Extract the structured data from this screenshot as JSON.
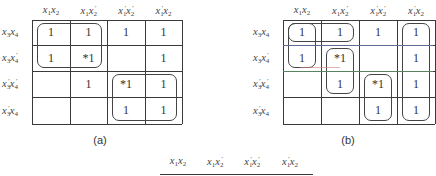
{
  "maps": [
    {
      "id": "a",
      "caption": "(a)",
      "columns": [
        "x1x2",
        "x1x2'",
        "x1'x2'",
        "x1'x2"
      ],
      "rows": [
        "x3x4",
        "x3x4'",
        "x3'x4'",
        "x3'x4"
      ],
      "cells": [
        [
          "1",
          "1",
          "1",
          "1"
        ],
        [
          "1",
          "*1",
          "",
          "1"
        ],
        [
          "",
          "1",
          "*1",
          "1"
        ],
        [
          "",
          "",
          "1",
          "1"
        ]
      ],
      "groups": [
        {
          "rows": [
            0,
            1
          ],
          "cols": [
            0,
            1
          ]
        },
        {
          "rows": [
            2,
            3
          ],
          "cols": [
            2,
            3
          ]
        }
      ]
    },
    {
      "id": "b",
      "caption": "(b)",
      "columns": [
        "x1x2",
        "x1x2'",
        "x1'x2'",
        "x1'x2"
      ],
      "rows": [
        "x3x4",
        "x3x4'",
        "x3'x4'",
        "x3'x4"
      ],
      "cells": [
        [
          "1",
          "1",
          "1",
          "1"
        ],
        [
          "1",
          "*1",
          "",
          "1"
        ],
        [
          "",
          "1",
          "*1",
          "1"
        ],
        [
          "",
          "",
          "1",
          "1"
        ]
      ],
      "groups": [
        {
          "rows": [
            0,
            0
          ],
          "cols": [
            0,
            1
          ]
        },
        {
          "rows": [
            0,
            1
          ],
          "cols": [
            0,
            0
          ]
        },
        {
          "rows": [
            1,
            2
          ],
          "cols": [
            1,
            1
          ]
        },
        {
          "rows": [
            2,
            3
          ],
          "cols": [
            2,
            2
          ]
        },
        {
          "rows": [
            0,
            3
          ],
          "cols": [
            3,
            3
          ]
        }
      ]
    }
  ],
  "partial_map": {
    "columns": [
      "x1x2",
      "x1x2'",
      "x1'x2'",
      "x1'x2"
    ]
  },
  "labels": {
    "col": [
      {
        "base": "x",
        "s1": "1",
        "p1": "",
        "base2": "x",
        "s2": "2",
        "p2": ""
      },
      {
        "base": "x",
        "s1": "1",
        "p1": "",
        "base2": "x",
        "s2": "2",
        "p2": "′"
      },
      {
        "base": "x",
        "s1": "1",
        "p1": "′",
        "base2": "x",
        "s2": "2",
        "p2": "′"
      },
      {
        "base": "x",
        "s1": "1",
        "p1": "′",
        "base2": "x",
        "s2": "2",
        "p2": ""
      }
    ],
    "row": [
      {
        "base": "x",
        "s1": "3",
        "p1": "",
        "base2": "x",
        "s2": "4",
        "p2": ""
      },
      {
        "base": "x",
        "s1": "3",
        "p1": "",
        "base2": "x",
        "s2": "4",
        "p2": "′"
      },
      {
        "base": "x",
        "s1": "3",
        "p1": "′",
        "base2": "x",
        "s2": "4",
        "p2": "′"
      },
      {
        "base": "x",
        "s1": "3",
        "p1": "′",
        "base2": "x",
        "s2": "4",
        "p2": ""
      }
    ]
  }
}
